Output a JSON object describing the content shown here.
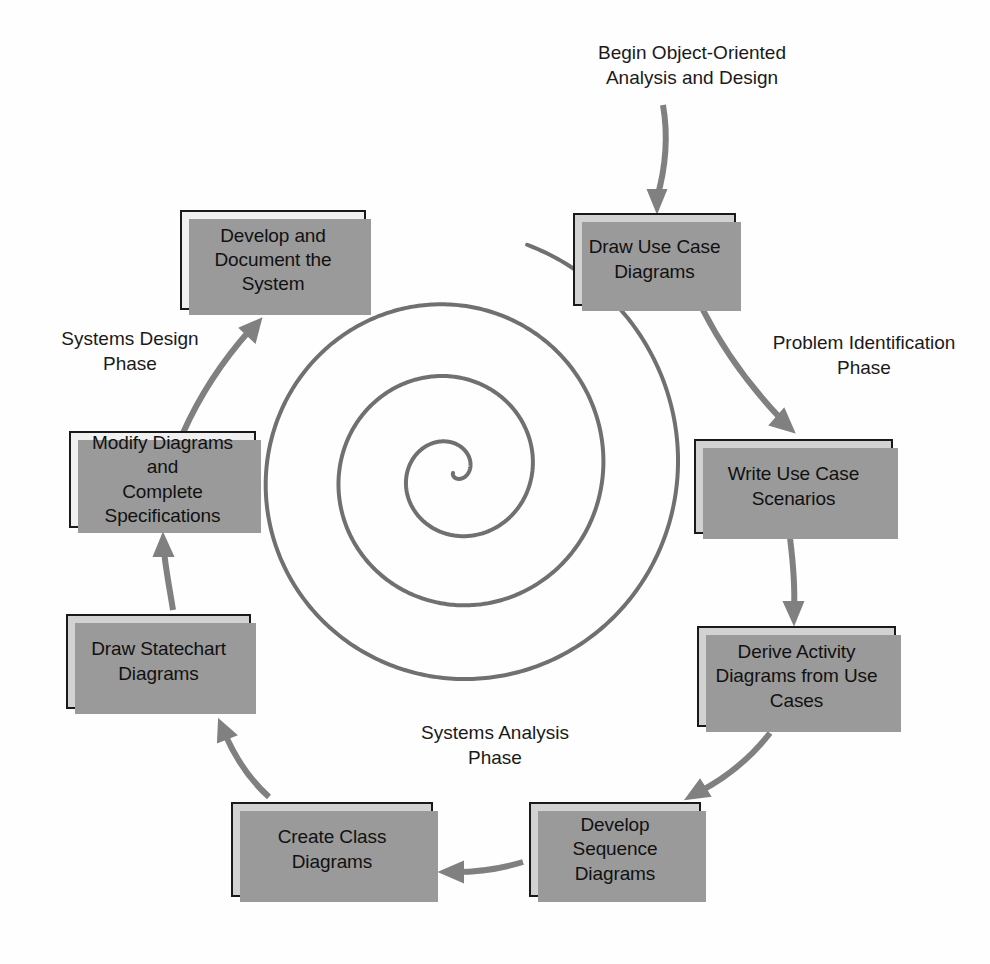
{
  "diagram": {
    "colors": {
      "box_fill_gray": "#d2d2d2",
      "box_fill_light": "#f0f0f0",
      "box_border": "#1a1a1a",
      "box_shadow": "#9a9a9a",
      "arrow": "#808080",
      "spiral": "#707070",
      "text": "#111111",
      "background": "#fefefe"
    },
    "center_graphic": {
      "name": "spiral",
      "turns": 3.5,
      "stroke_width": 4
    },
    "annotations": [
      {
        "id": "begin-label",
        "text": "Begin Object-Oriented\nAnalysis and Design",
        "x": 557,
        "y": 40,
        "width": 270
      },
      {
        "id": "problem-identification-phase",
        "text": "Problem Identification\nPhase",
        "x": 740,
        "y": 330,
        "width": 248
      },
      {
        "id": "systems-design-phase",
        "text": "Systems Design\nPhase",
        "x": 32,
        "y": 326,
        "width": 196
      },
      {
        "id": "systems-analysis-phase",
        "text": "Systems Analysis\nPhase",
        "x": 390,
        "y": 720,
        "width": 210
      }
    ],
    "nodes": [
      {
        "id": "draw-use-case-diagrams",
        "label": "Draw Use Case\nDiagrams",
        "fill": "gray",
        "x": 573,
        "y": 213,
        "width": 163,
        "height": 93
      },
      {
        "id": "write-use-case-scenarios",
        "label": "Write Use Case\nScenarios",
        "fill": "gray",
        "x": 694,
        "y": 439,
        "width": 199,
        "height": 95
      },
      {
        "id": "derive-activity-diagrams",
        "label": "Derive Activity\nDiagrams from Use\nCases",
        "fill": "gray",
        "x": 697,
        "y": 626,
        "width": 199,
        "height": 101
      },
      {
        "id": "develop-sequence-diagrams",
        "label": "Develop Sequence\nDiagrams",
        "fill": "gray",
        "x": 529,
        "y": 802,
        "width": 172,
        "height": 95
      },
      {
        "id": "create-class-diagrams",
        "label": "Create Class\nDiagrams",
        "fill": "gray",
        "x": 231,
        "y": 802,
        "width": 202,
        "height": 95
      },
      {
        "id": "draw-statechart-diagrams",
        "label": "Draw Statechart\nDiagrams",
        "fill": "gray",
        "x": 66,
        "y": 614,
        "width": 185,
        "height": 95
      },
      {
        "id": "modify-diagrams-complete-specifications",
        "label": "Modify Diagrams and\nComplete\nSpecifications",
        "fill": "light",
        "x": 69,
        "y": 431,
        "width": 187,
        "height": 97
      },
      {
        "id": "develop-and-document-the-system",
        "label": "Develop and\nDocument the\nSystem",
        "fill": "light",
        "x": 180,
        "y": 210,
        "width": 186,
        "height": 100
      }
    ],
    "arrows": [
      {
        "id": "arrow-begin-to-draw-use-case",
        "from": "begin-label",
        "to": "draw-use-case-diagrams",
        "path": "M 663 105 C 669 140, 665 170, 657 198",
        "tip": "M 657 212 L 648 190 L 666 190 Z"
      },
      {
        "id": "arrow-draw-use-case-to-write-use-case",
        "from": "draw-use-case-diagrams",
        "to": "write-use-case-scenarios",
        "path": "M 703 310 C 726 355, 758 395, 783 421",
        "tip": "M 794 432 L 770 425 L 784 409 Z"
      },
      {
        "id": "arrow-write-use-case-to-derive-activity",
        "from": "write-use-case-scenarios",
        "to": "derive-activity-diagrams",
        "path": "M 790 538 C 794 570, 795 590, 794 610",
        "tip": "M 794 624 L 784 602 L 803 602 Z"
      },
      {
        "id": "arrow-derive-activity-to-develop-sequence",
        "from": "derive-activity-diagrams",
        "to": "develop-sequence-diagrams",
        "path": "M 770 733 C 746 764, 718 782, 699 792",
        "tip": "M 686 799 L 700 780 L 710 796 Z"
      },
      {
        "id": "arrow-develop-sequence-to-create-class",
        "from": "develop-sequence-diagrams",
        "to": "create-class-diagrams",
        "path": "M 523 862 C 500 869, 478 872, 455 872",
        "tip": "M 440 872 L 463 862 L 463 882 Z"
      },
      {
        "id": "arrow-create-class-to-draw-statechart",
        "from": "create-class-diagrams",
        "to": "draw-statechart-diagrams",
        "path": "M 269 797 C 250 780, 235 757, 225 734",
        "tip": "M 219 720 L 236 735 L 218 742 Z"
      },
      {
        "id": "arrow-draw-statechart-to-modify-diagrams",
        "from": "draw-statechart-diagrams",
        "to": "modify-diagrams-complete-specifications",
        "path": "M 173 610 C 169 585, 165 565, 164 550",
        "tip": "M 163 534 L 154 556 L 173 556 Z"
      },
      {
        "id": "arrow-modify-diagrams-to-develop-document",
        "from": "modify-diagrams-complete-specifications",
        "to": "develop-and-document-the-system",
        "path": "M 183 433 C 200 395, 225 358, 250 330",
        "tip": "M 261 319 L 255 342 L 240 328 Z"
      }
    ]
  }
}
